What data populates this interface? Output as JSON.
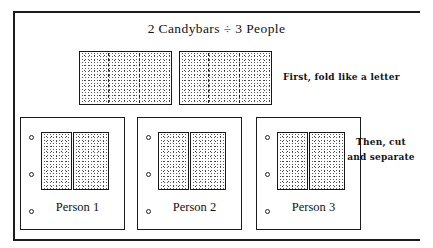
{
  "figure": {
    "title": "2 Candybars ÷ 3 People",
    "frame_color": "#1b1b1b",
    "background_color": "#ffffff"
  },
  "candybars": {
    "count": 2,
    "fold_sections": 3,
    "items": [
      {
        "id": "candybar-1",
        "name": "Candybar 1",
        "fold_lines": 2
      },
      {
        "id": "candybar-2",
        "name": "Candybar 2",
        "fold_lines": 2
      }
    ]
  },
  "persons": [
    {
      "label": "Person 1",
      "holes": 3,
      "pieces": 2
    },
    {
      "label": "Person 2",
      "holes": 3,
      "pieces": 2
    },
    {
      "label": "Person 3",
      "holes": 3,
      "pieces": 2
    }
  ],
  "annotations": {
    "fold": "First, fold like a letter",
    "cut_line1": "Then, cut",
    "cut_line2": "and separate"
  }
}
